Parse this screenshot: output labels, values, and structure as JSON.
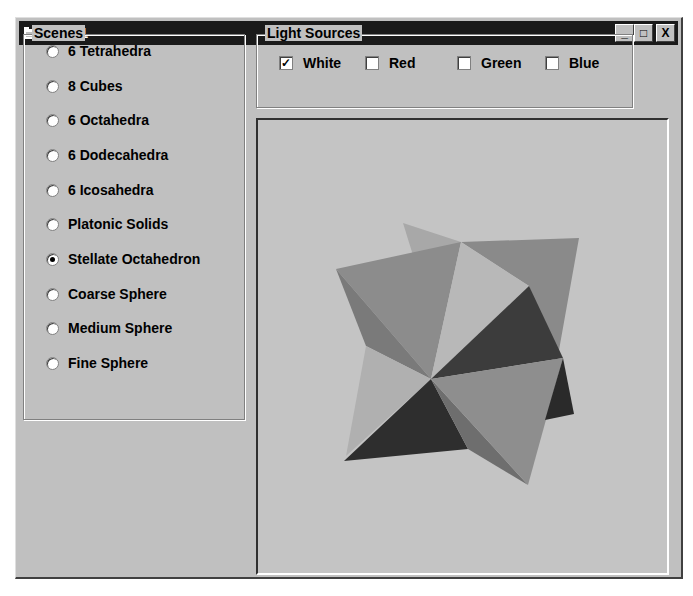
{
  "window": {
    "title": "Light1",
    "icon": "app-window-icon",
    "controls": {
      "minimize": "_",
      "maximize": "□",
      "close": "X"
    }
  },
  "scenes": {
    "label": "Scenes",
    "selected": "Stellate Octahedron",
    "options": [
      {
        "label": "6 Tetrahedra",
        "checked": false
      },
      {
        "label": "8 Cubes",
        "checked": false
      },
      {
        "label": "6 Octahedra",
        "checked": false
      },
      {
        "label": "6 Dodecahedra",
        "checked": false
      },
      {
        "label": "6 Icosahedra",
        "checked": false
      },
      {
        "label": "Platonic Solids",
        "checked": false
      },
      {
        "label": "Stellate Octahedron",
        "checked": true
      },
      {
        "label": "Coarse Sphere",
        "checked": false
      },
      {
        "label": "Medium Sphere",
        "checked": false
      },
      {
        "label": "Fine Sphere",
        "checked": false
      }
    ]
  },
  "light_sources": {
    "label": "Light Sources",
    "options": [
      {
        "label": "White",
        "checked": true
      },
      {
        "label": "Red",
        "checked": false
      },
      {
        "label": "Green",
        "checked": false
      },
      {
        "label": "Blue",
        "checked": false
      }
    ]
  },
  "viewport": {
    "scene": "Stellate Octahedron",
    "background": "#c4c4c4",
    "face_shades": [
      "#b4b4b4",
      "#8c8c8c",
      "#9a9a9a",
      "#a8a8a8",
      "#3a3a3a",
      "#7a7a7a",
      "#2c2c2c",
      "#6e6e6e"
    ]
  }
}
